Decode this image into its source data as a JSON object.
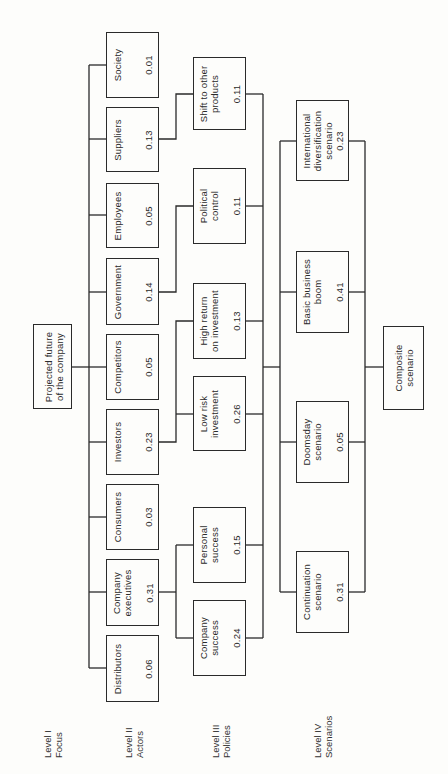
{
  "diagram": {
    "type": "hierarchy",
    "orientation": "rotated-90-ccw",
    "levels": [
      {
        "id": "level1",
        "label": "Level I\nFocus"
      },
      {
        "id": "level2",
        "label": "Level II\nActors"
      },
      {
        "id": "level3",
        "label": "Level III\nPolicies"
      },
      {
        "id": "level4",
        "label": "Level IV\nScenarios"
      }
    ],
    "focus": {
      "label": "Projected future\nof the company"
    },
    "actors": [
      {
        "label": "Society",
        "value": "0.01"
      },
      {
        "label": "Suppliers",
        "value": "0.13"
      },
      {
        "label": "Employees",
        "value": "0.05"
      },
      {
        "label": "Government",
        "value": "0.14"
      },
      {
        "label": "Competitors",
        "value": "0.05"
      },
      {
        "label": "Investors",
        "value": "0.23"
      },
      {
        "label": "Consumers",
        "value": "0.03"
      },
      {
        "label": "Company\nexecutives",
        "value": "0.31"
      },
      {
        "label": "Distributors",
        "value": "0.06"
      }
    ],
    "policies": [
      {
        "label": "Shift to other\nproducts",
        "value": "0.11"
      },
      {
        "label": "Political\ncontrol",
        "value": "0.11"
      },
      {
        "label": "High return\non investment",
        "value": "0.13"
      },
      {
        "label": "Low risk\ninvestment",
        "value": "0.26"
      },
      {
        "label": "Personal\nsuccess",
        "value": "0.15"
      },
      {
        "label": "Company\nsuccess",
        "value": "0.24"
      }
    ],
    "scenarios": [
      {
        "label": "International\ndiversification\nscenario",
        "value": "0.23"
      },
      {
        "label": "Basic business\nboom",
        "value": "0.41"
      },
      {
        "label": "Doomsday\nscenario",
        "value": "0.05"
      },
      {
        "label": "Continuation\nscenario",
        "value": "0.31"
      }
    ],
    "composite": {
      "label": "Composite\nscenario"
    }
  }
}
